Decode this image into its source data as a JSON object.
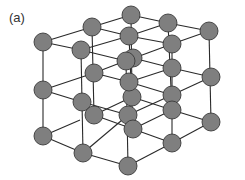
{
  "figure": {
    "label": "(a)",
    "colors": {
      "atom_fill": "#7f7f7f",
      "atom_stroke": "#3a3a3a",
      "bond": "#2a2a2a",
      "background": "#ffffff"
    },
    "atom_radius": 9
  }
}
